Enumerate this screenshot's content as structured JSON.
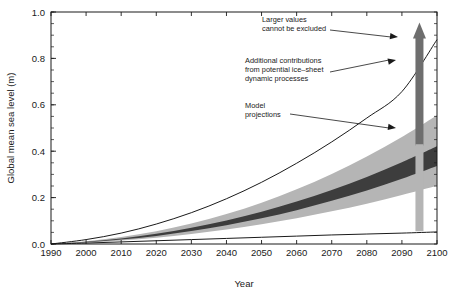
{
  "chart_data": {
    "type": "area",
    "title": "",
    "xlabel": "Year",
    "ylabel": "Global mean sea level (m)",
    "xlim": [
      1990,
      2100
    ],
    "ylim": [
      0.0,
      1.0
    ],
    "grid": false,
    "legend_position": "none",
    "xticks": [
      1990,
      2000,
      2010,
      2020,
      2030,
      2040,
      2050,
      2060,
      2070,
      2080,
      2090,
      2100
    ],
    "xtick_labels": [
      "1990",
      "2000",
      "2010",
      "2020",
      "2030",
      "2040",
      "2050",
      "2060",
      "2070",
      "2080",
      "2090",
      "2100"
    ],
    "yticks": [
      0.0,
      0.2,
      0.4,
      0.6,
      0.8,
      1.0
    ],
    "ytick_labels": [
      "0.0",
      "0.2",
      "0.4",
      "0.6",
      "0.8",
      "1.0"
    ],
    "yticks_minor_step": 0.05,
    "x": [
      1990,
      2000,
      2010,
      2020,
      2030,
      2040,
      2050,
      2060,
      2070,
      2080,
      2090,
      2100
    ],
    "series": [
      {
        "name": "Model projections envelope upper",
        "role": "light_band_upper",
        "values": [
          0.0,
          0.012,
          0.03,
          0.055,
          0.088,
          0.129,
          0.178,
          0.236,
          0.302,
          0.377,
          0.461,
          0.555
        ]
      },
      {
        "name": "Model projections envelope lower",
        "role": "light_band_lower",
        "values": [
          0.0,
          0.006,
          0.015,
          0.027,
          0.043,
          0.062,
          0.085,
          0.111,
          0.141,
          0.174,
          0.211,
          0.251
        ]
      },
      {
        "name": "Model projections central range upper",
        "role": "dark_band_upper",
        "values": [
          0.0,
          0.01,
          0.024,
          0.044,
          0.07,
          0.101,
          0.139,
          0.183,
          0.233,
          0.289,
          0.352,
          0.421
        ]
      },
      {
        "name": "Model projections central range lower",
        "role": "dark_band_lower",
        "values": [
          0.0,
          0.008,
          0.019,
          0.035,
          0.056,
          0.081,
          0.111,
          0.146,
          0.186,
          0.231,
          0.281,
          0.336
        ]
      },
      {
        "name": "Upper bound curve including ice-sheet dynamics",
        "role": "upper_curve",
        "values": [
          0.0,
          0.019,
          0.047,
          0.086,
          0.135,
          0.195,
          0.266,
          0.348,
          0.44,
          0.543,
          0.657,
          0.881
        ]
      },
      {
        "name": "Lower bound curve",
        "role": "lower_curve",
        "values": [
          0.0,
          0.004,
          0.009,
          0.014,
          0.019,
          0.024,
          0.029,
          0.034,
          0.039,
          0.043,
          0.047,
          0.052
        ]
      }
    ],
    "markers": [
      {
        "name": "ice-sheet-dynamics-bar",
        "type": "vertical_bar_with_arrow",
        "x": 2095,
        "y_bottom": 0.425,
        "y_top": 0.955,
        "color": "#6e6e6e",
        "arrow": "up"
      },
      {
        "name": "model-projections-bar",
        "type": "vertical_bar",
        "x": 2095,
        "y_bottom": 0.055,
        "y_top": 0.43,
        "color": "#b5b5b5"
      }
    ],
    "annotations": [
      {
        "name": "larger-values-annotation",
        "lines": [
          "Larger values",
          "cannot be excluded"
        ],
        "target_x": 2095,
        "target_y": 0.93
      },
      {
        "name": "ice-sheet-annotation",
        "lines": [
          "Additional contributions",
          "from potential ice–sheet",
          "dynamic processes"
        ],
        "target_x": 2095,
        "target_y": 0.705
      },
      {
        "name": "model-projections-annotation",
        "lines": [
          "Model",
          "projections"
        ],
        "target_x": 2095,
        "target_y": 0.345
      }
    ],
    "colors": {
      "light_band": "#b5b5b5",
      "dark_band": "#3d3d3d",
      "curve": "#000000",
      "arrow_bar": "#6e6e6e",
      "axis": "#1a1a1a",
      "background": "#ffffff"
    }
  }
}
